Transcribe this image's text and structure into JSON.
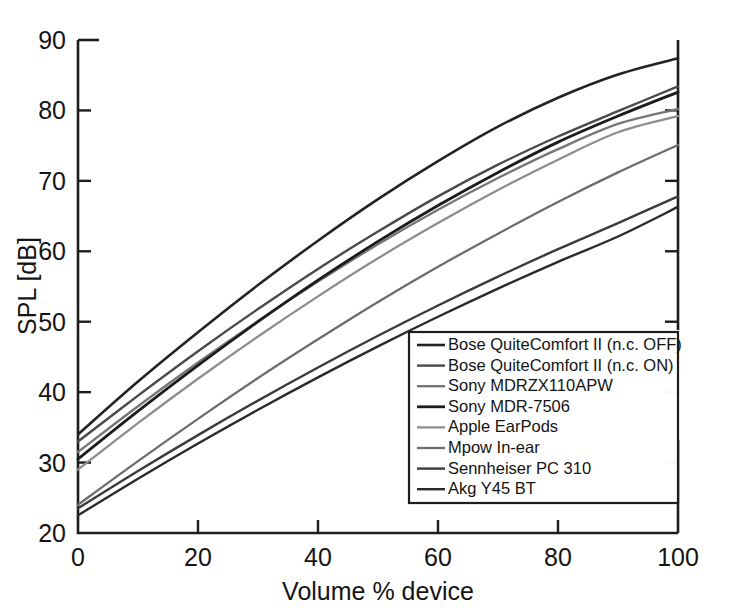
{
  "chart_data": {
    "type": "line",
    "title": "",
    "xlabel": "Volume % device",
    "ylabel": "SPL [dB]",
    "xlim": [
      0,
      100
    ],
    "ylim": [
      20,
      90
    ],
    "xticks": [
      0,
      20,
      40,
      60,
      80,
      100
    ],
    "yticks": [
      20,
      30,
      40,
      50,
      60,
      70,
      80,
      90
    ],
    "xticklabels": [
      "0",
      "20",
      "40",
      "60",
      "80",
      "100"
    ],
    "yticklabels": [
      "20",
      "30",
      "40",
      "50",
      "60",
      "70",
      "80",
      "90"
    ],
    "grid": false,
    "legend_position": "lower right",
    "x": [
      0,
      10,
      20,
      30,
      40,
      50,
      60,
      70,
      80,
      90,
      100
    ],
    "series": [
      {
        "name": "Bose QuiteComfort II (n.c. OFF)",
        "color": "#232323",
        "width": 2.6,
        "values": [
          34.0,
          41.5,
          48.5,
          55.2,
          61.5,
          67.4,
          72.8,
          77.7,
          81.8,
          85.1,
          87.4
        ]
      },
      {
        "name": "Bose QuiteComfort II (n.c. ON)",
        "color": "#4a4a4a",
        "width": 2.4,
        "values": [
          33.0,
          39.5,
          45.8,
          51.8,
          57.5,
          62.8,
          67.8,
          72.3,
          76.3,
          79.9,
          83.4
        ]
      },
      {
        "name": "Sony MDRZX110APW",
        "color": "#767676",
        "width": 2.4,
        "values": [
          31.5,
          38.0,
          44.2,
          50.1,
          55.7,
          61.0,
          65.9,
          70.4,
          74.5,
          78.1,
          80.2
        ]
      },
      {
        "name": "Sony MDR-7506",
        "color": "#1c1c1c",
        "width": 2.8,
        "values": [
          30.5,
          37.3,
          43.8,
          50.0,
          55.9,
          61.4,
          66.5,
          71.2,
          75.5,
          79.2,
          82.6
        ]
      },
      {
        "name": "Apple EarPods",
        "color": "#8d8d8d",
        "width": 2.3,
        "values": [
          29.0,
          35.6,
          41.9,
          47.9,
          53.6,
          59.0,
          64.0,
          68.7,
          73.0,
          76.9,
          79.2
        ]
      },
      {
        "name": "Mpow In-ear",
        "color": "#6d6d6d",
        "width": 2.3,
        "values": [
          24.0,
          30.2,
          36.2,
          42.0,
          47.5,
          52.8,
          57.8,
          62.5,
          67.0,
          71.2,
          75.1
        ]
      },
      {
        "name": "Sennheiser PC 310",
        "color": "#3b3b3b",
        "width": 2.4,
        "values": [
          23.5,
          28.8,
          33.9,
          38.8,
          43.5,
          48.0,
          52.3,
          56.4,
          60.3,
          64.0,
          67.8
        ]
      },
      {
        "name": "Akg Y45 BT",
        "color": "#2a2a2a",
        "width": 2.4,
        "values": [
          22.5,
          27.7,
          32.7,
          37.5,
          42.1,
          46.5,
          50.7,
          54.7,
          58.5,
          62.1,
          66.3
        ]
      }
    ]
  },
  "figure": {
    "xlabel": "Volume % device",
    "ylabel": "SPL [dB]"
  }
}
